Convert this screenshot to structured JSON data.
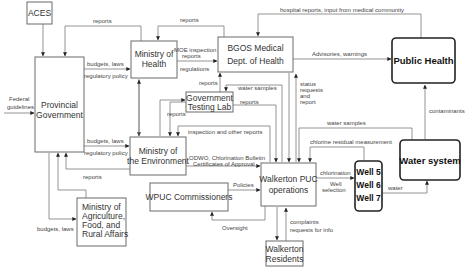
{
  "nodes": {
    "aces": {
      "label": "ACES"
    },
    "provincial_government": {
      "line1": "Provincial",
      "line2": "Government"
    },
    "ministry_health": {
      "line1": "Ministry of",
      "line2": "Health"
    },
    "bgos": {
      "line1": "BGOS Medical",
      "line2": "Dept. of Health"
    },
    "public_health": {
      "label": "Public Health"
    },
    "testing_lab": {
      "line1": "Government",
      "line2": "Testing Lab"
    },
    "ministry_environment": {
      "line1": "Ministry of",
      "line2": "the Environment"
    },
    "water_system": {
      "label": "Water system"
    },
    "walkerton_puc": {
      "line1": "Walkerton PUC",
      "line2": "operations"
    },
    "wells": {
      "well1": "Well 5",
      "well2": "Well 6",
      "well3": "Well 7"
    },
    "wpuc_commissioners": {
      "label": "WPUC Commissioners"
    },
    "ministry_agriculture": {
      "line1": "Ministry of",
      "line2": "Agriculture,",
      "line3": "Food, and",
      "line4": "Rural Affairs"
    },
    "walkerton_residents": {
      "line1": "Walkerton",
      "line2": "Residents"
    }
  },
  "edges": {
    "hospital_reports": "hospital reports, input from medical community",
    "reports_top_provincial": "reports",
    "reports_top_moh": "reports",
    "budgets_laws_moh": "budgets, laws",
    "regulatory_policy_moh": "regulatory policy",
    "moe_inspection_1": "MOE inspection",
    "moe_inspection_2": "reports",
    "regulations": "regulations",
    "advisories": "Advisories, warnings",
    "federal_1": "Federal",
    "federal_2": "guidelines",
    "reports_lab_bgos": "reports",
    "water_samples_lab": "water samples",
    "status_1": "status",
    "status_2": "requests",
    "status_3": "and",
    "status_4": "report",
    "reports_lab_moe": "reports",
    "reports_lab_puc": "reports",
    "inspection_other": "inspection and other reports",
    "budgets_laws_moe": "budgets, laws",
    "regulatory_policy_moe": "regulatory policy",
    "odwo_1": "ODWO, Chlorination Bulletin",
    "odwo_2": "Certificates of Approval",
    "reports_moe_provincial": "reports",
    "water_samples_ws": "water samples",
    "chlorine_residual": "chlorine residual measurement",
    "contaminants": "contaminants",
    "chlorination": "chlorination",
    "well_selection_1": "Well",
    "well_selection_2": "selection",
    "water": "water",
    "policies": "Policies",
    "oversight": "Oversight",
    "complaints_1": "complaints",
    "complaints_2": "requests for info",
    "budgets_laws_agri": "budgets, laws"
  },
  "colors": {
    "line": "#7a7a7a",
    "box_border": "#6a6a6a",
    "bold_border": "#222222",
    "text": "#333333"
  }
}
